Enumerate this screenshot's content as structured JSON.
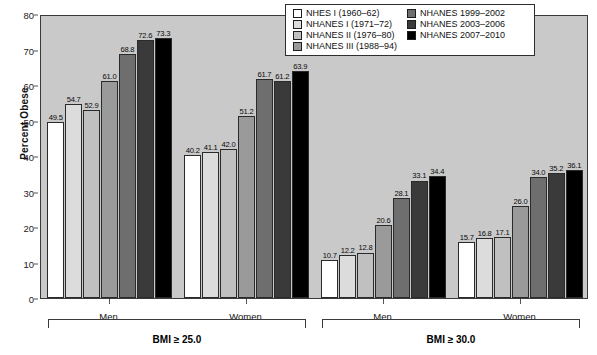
{
  "chart_data": {
    "type": "bar",
    "title": "",
    "xlabel": "",
    "ylabel": "Percent Obese",
    "ylim": [
      0,
      80
    ],
    "yticks": [
      0,
      10,
      20,
      30,
      40,
      50,
      60,
      70,
      80
    ],
    "grid": false,
    "legend_position": "top-right",
    "categories": [
      "BMI ≥ 25.0 / Men",
      "BMI ≥ 25.0 / Women",
      "BMI ≥ 30.0 / Men",
      "BMI ≥ 30.0 / Women"
    ],
    "series": [
      {
        "name": "NHES I (1960–62)",
        "color": "#ffffff",
        "values": [
          49.5,
          40.2,
          10.7,
          15.7
        ]
      },
      {
        "name": "NHANES I (1971–72)",
        "color": "#dcdcdc",
        "values": [
          54.7,
          41.1,
          12.2,
          16.8
        ]
      },
      {
        "name": "NHANES II (1976–80)",
        "color": "#c0c0c0",
        "values": [
          52.9,
          42.0,
          12.8,
          17.1
        ]
      },
      {
        "name": "NHANES III (1988–94)",
        "color": "#9a9a9a",
        "values": [
          61.0,
          51.2,
          20.6,
          26.0
        ]
      },
      {
        "name": "NHANES 1999–2002",
        "color": "#6e6e6e",
        "values": [
          68.8,
          61.7,
          28.1,
          34.0
        ]
      },
      {
        "name": "NHANES 2003–2006",
        "color": "#3a3a3a",
        "values": [
          72.6,
          61.2,
          33.1,
          35.2
        ]
      },
      {
        "name": "NHANES 2007–2010",
        "color": "#000000",
        "values": [
          73.3,
          63.9,
          34.4,
          36.1
        ]
      }
    ]
  },
  "axis": {
    "y_title": "Percent Obese",
    "y_ticks": [
      "80",
      "70",
      "60",
      "50",
      "40",
      "30",
      "20",
      "10",
      "0"
    ]
  },
  "legend": {
    "column_left": [
      {
        "label": "NHES I (1960–62)",
        "swatch": "#ffffff"
      },
      {
        "label": "NHANES I (1971–72)",
        "swatch": "#dcdcdc"
      },
      {
        "label": "NHANES II (1976–80)",
        "swatch": "#c0c0c0"
      },
      {
        "label": "NHANES III (1988–94)",
        "swatch": "#9a9a9a"
      }
    ],
    "column_right": [
      {
        "label": "NHANES 1999–2002",
        "swatch": "#6e6e6e"
      },
      {
        "label": "NHANES 2003–2006",
        "swatch": "#3a3a3a"
      },
      {
        "label": "NHANES 2007–2010",
        "swatch": "#000000"
      }
    ]
  },
  "panels": [
    {
      "bmi_label": "BMI ≥ 25.0",
      "groups": [
        {
          "sex": "Men",
          "values": [
            "49.5",
            "54.7",
            "52.9",
            "61.0",
            "68.8",
            "72.6",
            "73.3"
          ]
        },
        {
          "sex": "Women",
          "values": [
            "40.2",
            "41.1",
            "42.0",
            "51.2",
            "61.7",
            "61.2",
            "63.9"
          ]
        }
      ]
    },
    {
      "bmi_label": "BMI ≥ 30.0",
      "groups": [
        {
          "sex": "Men",
          "values": [
            "10.7",
            "12.2",
            "12.8",
            "20.6",
            "28.1",
            "33.1",
            "34.4"
          ]
        },
        {
          "sex": "Women",
          "values": [
            "15.7",
            "16.8",
            "17.1",
            "26.0",
            "34.0",
            "35.2",
            "36.1"
          ]
        }
      ]
    }
  ]
}
